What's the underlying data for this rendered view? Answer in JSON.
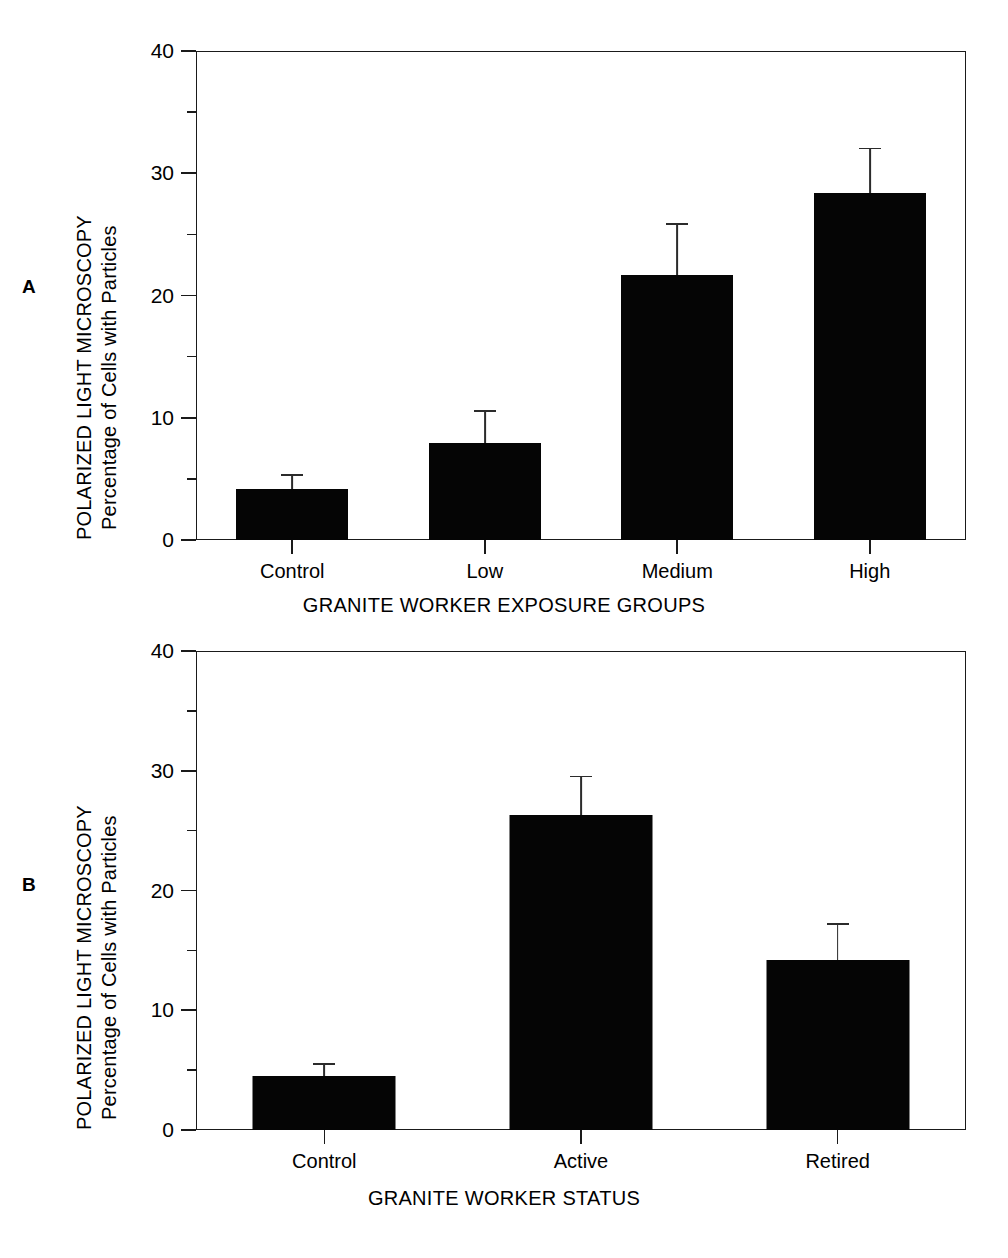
{
  "figure": {
    "panel_a_letter": "A",
    "panel_b_letter": "B"
  },
  "axis": {
    "y_title_line1": "POLARIZED LIGHT MICROSCOPY",
    "y_title_line2": "Percentage of Cells with Particles",
    "y_tick_labels": [
      "0",
      "10",
      "20",
      "30",
      "40"
    ],
    "y_tick_values": [
      0,
      10,
      20,
      30,
      40
    ],
    "y_minor_values": [
      5,
      15,
      25,
      35
    ]
  },
  "panel_a": {
    "x_title": "GRANITE WORKER EXPOSURE GROUPS",
    "x_tick_labels": [
      "Control",
      "Low",
      "Medium",
      "High"
    ]
  },
  "panel_b": {
    "x_title": "GRANITE WORKER STATUS",
    "x_tick_labels": [
      "Control",
      "Active",
      "Retired"
    ]
  },
  "chart_data": [
    {
      "type": "bar",
      "panel": "A",
      "title": "",
      "xlabel": "GRANITE WORKER EXPOSURE GROUPS",
      "ylabel": "POLARIZED LIGHT MICROSCOPY Percentage of Cells with Particles",
      "categories": [
        "Control",
        "Low",
        "Medium",
        "High"
      ],
      "values": [
        4.2,
        7.9,
        21.7,
        28.4
      ],
      "errors_upper": [
        5.4,
        10.6,
        25.9,
        32.1
      ],
      "error_magnitudes": [
        1.2,
        2.7,
        4.2,
        3.7
      ],
      "ylim": [
        0,
        40
      ],
      "yticks": [
        0,
        10,
        20,
        30,
        40
      ],
      "yminorticks": [
        5,
        15,
        25,
        35
      ],
      "grid": false,
      "legend": "none",
      "bar_color": "#050505"
    },
    {
      "type": "bar",
      "panel": "B",
      "title": "",
      "xlabel": "GRANITE WORKER STATUS",
      "ylabel": "POLARIZED LIGHT MICROSCOPY Percentage of Cells with Particles",
      "categories": [
        "Control",
        "Active",
        "Retired"
      ],
      "values": [
        4.5,
        26.3,
        14.2
      ],
      "errors_upper": [
        5.6,
        29.6,
        17.3
      ],
      "error_magnitudes": [
        1.1,
        3.3,
        3.1
      ],
      "ylim": [
        0,
        40
      ],
      "yticks": [
        0,
        10,
        20,
        30,
        40
      ],
      "yminorticks": [
        5,
        15,
        25,
        35
      ],
      "grid": false,
      "legend": "none",
      "bar_color": "#050505"
    }
  ]
}
